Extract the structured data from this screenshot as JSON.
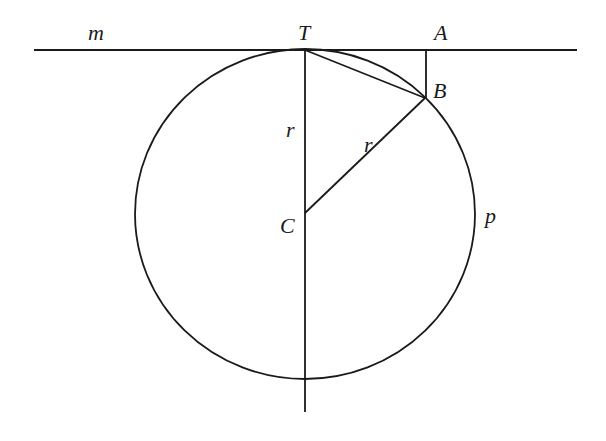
{
  "diagram": {
    "labels": {
      "m": "m",
      "T": "T",
      "A": "A",
      "B": "B",
      "C": "C",
      "r_vertical": "r",
      "r_diagonal": "r",
      "p": "p"
    },
    "colors": {
      "stroke": "#1a1a1a",
      "background": "#ffffff"
    }
  }
}
